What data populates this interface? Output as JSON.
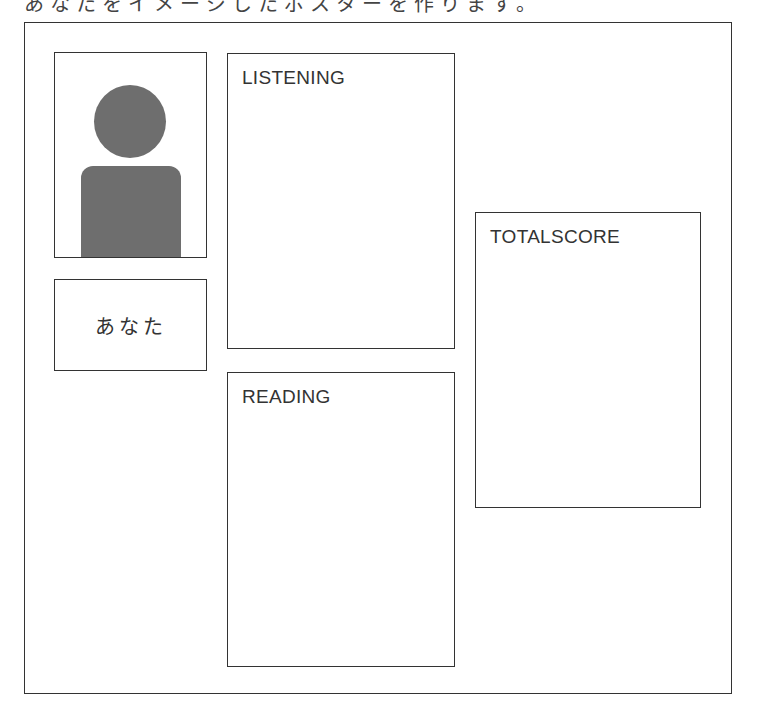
{
  "page": {
    "caption_cropped": "あなたをイメージしたポスターを作ります。"
  },
  "profile": {
    "avatar_icon": "person-silhouette-icon",
    "avatar_color": "#6e6e6e",
    "name": "あなた"
  },
  "sections": {
    "listening": {
      "label": "LISTENING"
    },
    "reading": {
      "label": "READING"
    },
    "total": {
      "label": "TOTALSCORE"
    }
  }
}
